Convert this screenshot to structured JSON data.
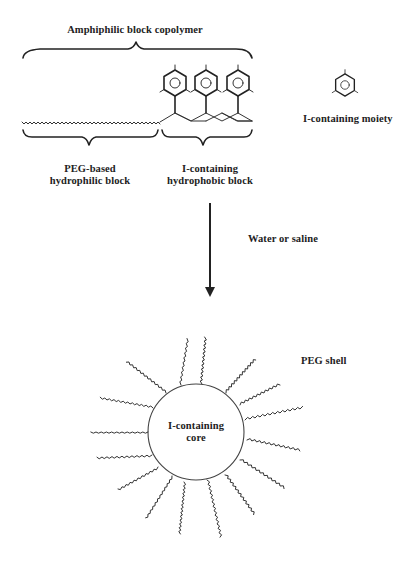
{
  "labels": {
    "copolymer_title": "Amphiphilic block copolymer",
    "moiety_label": "I-containing moiety",
    "peg_block_line1": "PEG-based",
    "peg_block_line2": "hydrophilic block",
    "i_block_line1": "I-containing",
    "i_block_line2": "hydrophobic block",
    "process_label": "Water or saline",
    "shell_label": "PEG shell",
    "core_line1": "I-containing",
    "core_line2": "core"
  },
  "icons": {
    "moiety_glyph": "benzene-ring-icon",
    "arrow": "arrow-down-icon"
  },
  "colors": {
    "ink": "#222222",
    "background": "#ffffff"
  },
  "micelle": {
    "core_center": [
      196,
      432
    ],
    "core_radius": 48,
    "ray_count": 15
  }
}
